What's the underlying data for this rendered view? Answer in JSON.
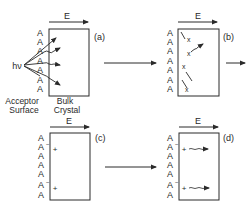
{
  "field_label": "E",
  "photon_label": "hν",
  "surface_label_line1": "Acceptor",
  "surface_label_line2": "Surface",
  "bulk_label_line1": "Bulk",
  "bulk_label_line2": "Crystal",
  "acceptor_symbol": "A",
  "ionized_acceptor_symbol": "A",
  "ionized_superscript": "−",
  "hole_symbol": "+",
  "exciton_symbol": "x",
  "panels": [
    {
      "id": "a",
      "label": "(a)",
      "description": "Photon excitation hν creating excitons near the acceptor surface"
    },
    {
      "id": "b",
      "label": "(b)",
      "description": "Excitons (x) diffusing in the bulk crystal"
    },
    {
      "id": "c",
      "label": "(c)",
      "description": "Charge transfer: ionized acceptors A− at surface with holes (+) in crystal"
    },
    {
      "id": "d",
      "label": "(d)",
      "description": "Holes (+) drifting into bulk under field E"
    }
  ],
  "colors": {
    "stroke": "#2a2a2a",
    "background": "#ffffff"
  }
}
